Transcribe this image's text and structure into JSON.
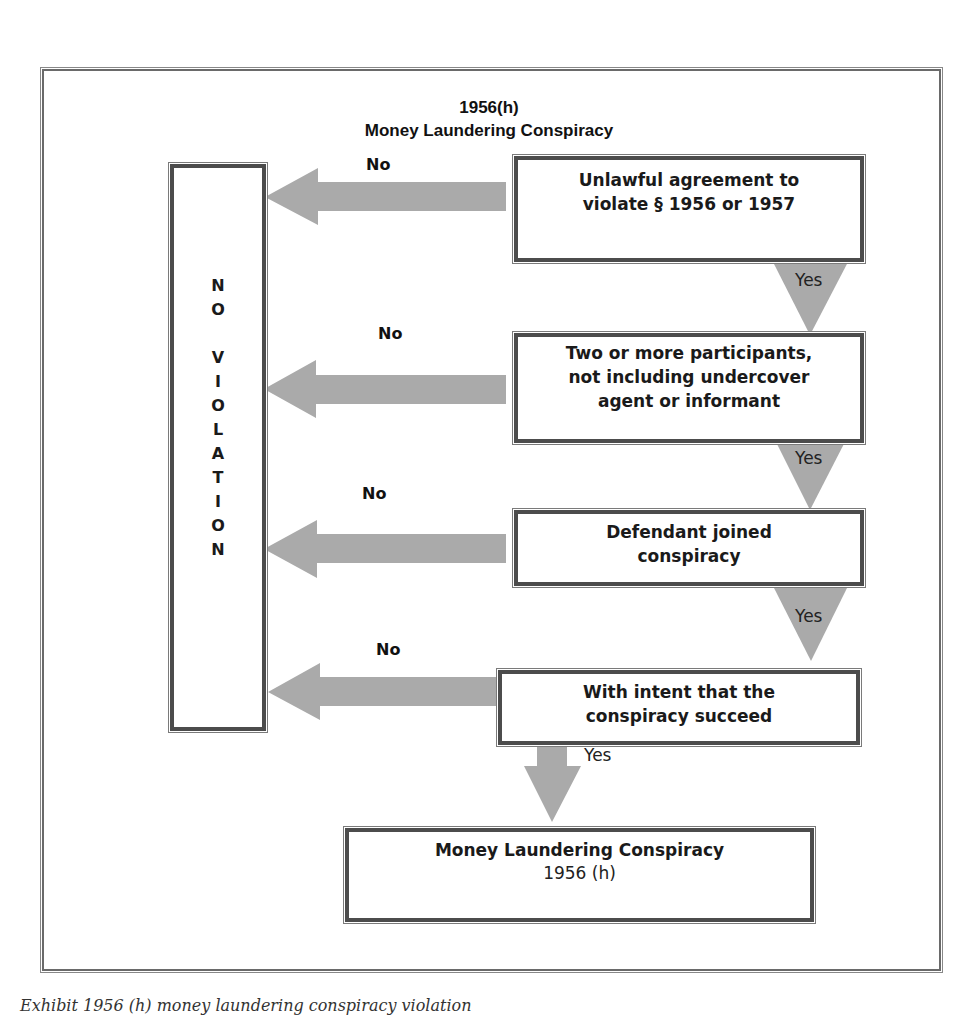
{
  "title": {
    "line1": "1956(h)",
    "line2": "Money Laundering Conspiracy"
  },
  "no_violation": {
    "letters": [
      "N",
      "O",
      "",
      "V",
      "I",
      "O",
      "L",
      "A",
      "T",
      "I",
      "O",
      "N"
    ]
  },
  "steps": [
    {
      "text_lines": [
        "Unlawful agreement to",
        "violate § 1956 or 1957"
      ],
      "no_label": "No",
      "yes_label": "Yes"
    },
    {
      "text_lines": [
        "Two or more participants,",
        "not including undercover",
        "agent or informant"
      ],
      "no_label": "No",
      "yes_label": "Yes"
    },
    {
      "text_lines": [
        "Defendant joined",
        "conspiracy"
      ],
      "no_label": "No",
      "yes_label": "Yes"
    },
    {
      "text_lines": [
        "With intent that the",
        "conspiracy succeed"
      ],
      "no_label": "No",
      "yes_label": "Yes"
    }
  ],
  "result": {
    "title": "Money Laundering Conspiracy",
    "subtitle": "1956 (h)"
  },
  "caption": "Exhibit 1956 (h) money laundering conspiracy violation",
  "colors": {
    "arrow_fill": "#aaaaaa",
    "box_border": "#4c4c4c",
    "text": "#1a1a1a"
  }
}
